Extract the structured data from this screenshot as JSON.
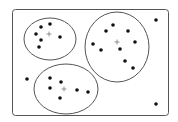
{
  "diagram": {
    "type": "cluster-diagram",
    "frame": {
      "x": 12,
      "y": 9,
      "width": 156,
      "height": 106,
      "rx": 3
    },
    "colors": {
      "stroke": "#555555",
      "point": "#111111",
      "centroid": "#777777",
      "background": "#ffffff"
    },
    "clusters": [
      {
        "id": "cluster-1",
        "ellipse": {
          "cx": 50,
          "cy": 39,
          "rx": 26,
          "ry": 21
        },
        "centroid": {
          "x": 49,
          "y": 34
        },
        "points": [
          [
            41,
            27
          ],
          [
            50,
            24
          ],
          [
            36,
            34
          ],
          [
            41,
            40
          ],
          [
            60,
            37
          ],
          [
            39,
            47
          ]
        ]
      },
      {
        "id": "cluster-2",
        "ellipse": {
          "cx": 117,
          "cy": 47,
          "rx": 32,
          "ry": 35
        },
        "centroid": {
          "x": 117,
          "y": 42
        },
        "points": [
          [
            106,
            31
          ],
          [
            113,
            25
          ],
          [
            128,
            31
          ],
          [
            93,
            44
          ],
          [
            101,
            50
          ],
          [
            135,
            42
          ],
          [
            120,
            49
          ],
          [
            125,
            61
          ],
          [
            133,
            68
          ]
        ]
      },
      {
        "id": "cluster-3",
        "ellipse": {
          "cx": 66,
          "cy": 89,
          "rx": 32,
          "ry": 25
        },
        "centroid": {
          "x": 64,
          "y": 89
        },
        "points": [
          [
            50,
            78
          ],
          [
            61,
            82
          ],
          [
            50,
            88
          ],
          [
            77,
            90
          ],
          [
            88,
            92
          ],
          [
            60,
            98
          ]
        ]
      }
    ],
    "outliers": [
      [
        156,
        20
      ],
      [
        27,
        79
      ],
      [
        156,
        104
      ]
    ]
  }
}
